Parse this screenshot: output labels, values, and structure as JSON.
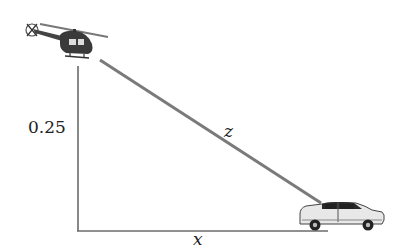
{
  "diagram": {
    "title": "",
    "height_label": "0.25",
    "hypotenuse_label": "z",
    "base_label": "x",
    "objects": [
      {
        "name": "helicopter",
        "icon": "helicopter-icon"
      },
      {
        "name": "car",
        "icon": "car-icon"
      }
    ],
    "colors": {
      "line": "#6b6b6b",
      "hypotenuse": "#7a7a7a",
      "text": "#222222"
    }
  }
}
